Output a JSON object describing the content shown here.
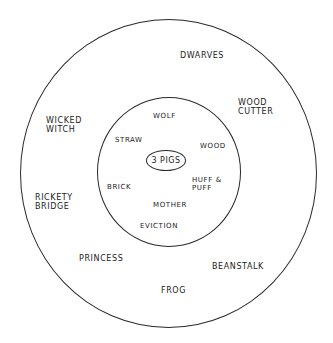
{
  "diagram": {
    "type": "concentric-circles",
    "center": {
      "label": "3 Pigs"
    },
    "inner_ring": {
      "labels": [
        "Wolf",
        "Straw",
        "Wood",
        "Brick",
        "Huff &\nPuff",
        "Mother",
        "Eviction"
      ]
    },
    "outer_ring": {
      "labels": [
        "Dwarves",
        "Wood\nCutter",
        "Wicked\nWitch",
        "Rickety\nBridge",
        "Princess",
        "Beanstalk",
        "Frog"
      ]
    },
    "colors": {
      "ink": "#222222",
      "background": "#ffffff"
    }
  }
}
